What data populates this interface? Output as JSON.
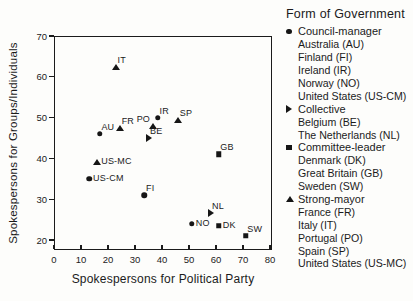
{
  "colors": {
    "ink": "#1b1b1b",
    "marker": "#161616",
    "background": "#fdfdfb"
  },
  "chart_data": {
    "type": "scatter",
    "title": "",
    "legend_title": "Form of Government",
    "xlabel": "Spokespersons for Political Party",
    "ylabel": "Spokespersons for Groups/Individuals",
    "xlim": [
      0,
      80
    ],
    "ylim": [
      20,
      70
    ],
    "xticks": [
      0,
      10,
      20,
      30,
      40,
      50,
      60,
      70,
      80
    ],
    "yticks": [
      20,
      30,
      40,
      50,
      60,
      70
    ],
    "grid": false,
    "legend_position": "right",
    "series": [
      {
        "name": "Council-manager",
        "marker": "circle",
        "legend_items": [
          "Australia (AU)",
          "Finland (FI)",
          "Ireland (IR)",
          "Norway (NO)",
          "United States (US-CM)"
        ],
        "points": [
          {
            "label": "AU",
            "x": 17,
            "y": 46,
            "label_pos": "top-right"
          },
          {
            "label": "FI",
            "x": 33.5,
            "y": 31,
            "label_pos": "top-right"
          },
          {
            "label": "IR",
            "x": 38.5,
            "y": 50,
            "label_pos": "top-right"
          },
          {
            "label": "NO",
            "x": 51,
            "y": 24,
            "label_pos": "right"
          },
          {
            "label": "US-CM",
            "x": 13,
            "y": 35,
            "label_pos": "right"
          }
        ]
      },
      {
        "name": "Collective",
        "marker": "triangle-right",
        "legend_items": [
          "Belgium (BE)",
          "The Netherlands (NL)"
        ],
        "points": [
          {
            "label": "BE",
            "x": 35,
            "y": 45,
            "label_pos": "top-right"
          },
          {
            "label": "NL",
            "x": 58,
            "y": 26.5,
            "label_pos": "top-right"
          }
        ]
      },
      {
        "name": "Committee-leader",
        "marker": "square",
        "legend_items": [
          "Denmark (DK)",
          "Great Britain (GB)",
          "Sweden (SW)"
        ],
        "points": [
          {
            "label": "DK",
            "x": 61,
            "y": 23.5,
            "label_pos": "right"
          },
          {
            "label": "GB",
            "x": 61,
            "y": 41,
            "label_pos": "top-right"
          },
          {
            "label": "SW",
            "x": 71,
            "y": 21,
            "label_pos": "top-right"
          }
        ]
      },
      {
        "name": "Strong-mayor",
        "marker": "triangle-up",
        "legend_items": [
          "France (FR)",
          "Italy (IT)",
          "Portugal (PO)",
          "Spain (SP)",
          "United States (US-MC)"
        ],
        "points": [
          {
            "label": "FR",
            "x": 24.5,
            "y": 47.5,
            "label_pos": "top-right"
          },
          {
            "label": "IT",
            "x": 23,
            "y": 62.5,
            "label_pos": "top-right"
          },
          {
            "label": "PO",
            "x": 36.5,
            "y": 48,
            "label_pos": "top-left"
          },
          {
            "label": "SP",
            "x": 46,
            "y": 49.5,
            "label_pos": "top-right"
          },
          {
            "label": "US-MC",
            "x": 16,
            "y": 39,
            "label_pos": "right"
          }
        ]
      }
    ]
  }
}
